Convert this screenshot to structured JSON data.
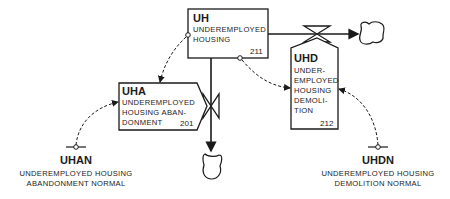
{
  "diagram": {
    "type": "system-dynamics-flow-diagram",
    "levels": [
      {
        "id": "UH",
        "code": "UH",
        "lines": [
          "UNDEREMPLOYED",
          "HOUSING"
        ],
        "number": "211"
      }
    ],
    "rates": [
      {
        "id": "UHA",
        "code": "UHA",
        "lines": [
          "UNDEREMPLOYED",
          "HOUSING ABAN-",
          "DONMENT"
        ],
        "number": "201"
      },
      {
        "id": "UHD",
        "code": "UHD",
        "lines": [
          "UNDER-",
          "EMPLOYED",
          "HOUSING",
          "DEMOLI-",
          "TION"
        ],
        "number": "212"
      }
    ],
    "constants": [
      {
        "id": "UHAN",
        "code": "UHAN",
        "lines": [
          "UNDEREMPLOYED HOUSING",
          "ABANDONMENT NORMAL"
        ]
      },
      {
        "id": "UHDN",
        "code": "UHDN",
        "lines": [
          "UNDEREMPLOYED HOUSING",
          "DEMOLITION NORMAL"
        ]
      }
    ],
    "flows": [
      {
        "from": "UH",
        "to": "sink-right",
        "via": "UHD"
      },
      {
        "from": "UH",
        "to": "sink-bottom",
        "via": "UHA"
      }
    ],
    "info_links": [
      {
        "from": "UH",
        "to": "UHA"
      },
      {
        "from": "UH",
        "to": "UHD"
      },
      {
        "from": "UHAN",
        "to": "UHA"
      },
      {
        "from": "UHDN",
        "to": "UHD"
      }
    ],
    "colors": {
      "ink": "#1a1a1a",
      "background": "#ffffff"
    }
  }
}
